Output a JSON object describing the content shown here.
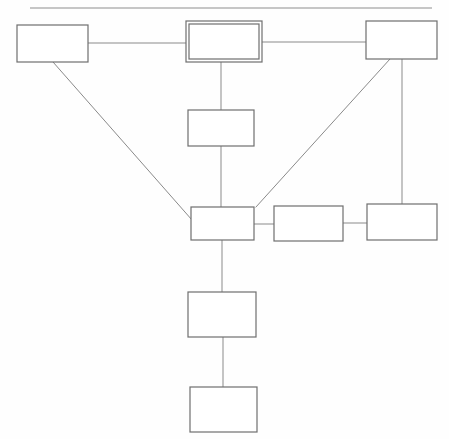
{
  "page": {
    "width": 449,
    "height": 439,
    "background_color": "#fefefe",
    "header_rule": {
      "name": "top-horizontal-rule",
      "x1": 30,
      "y1": 8,
      "x2": 432,
      "y2": 8,
      "color": "#8d8d8d",
      "stroke_width": 1.2
    }
  },
  "style": {
    "box_stroke_color": "#6e6e6e",
    "box_stroke_width": 1.2,
    "box_fill_color": "#ffffff",
    "connector_color": "#8a8a8a",
    "connector_width": 1,
    "emphasis_stroke_color": "#6e6e6e"
  },
  "nodes": [
    {
      "id": "node-top-left",
      "name": "box-top-left",
      "label": "",
      "x": 17,
      "y": 25,
      "width": 71,
      "height": 37,
      "double_border": false
    },
    {
      "id": "node-top-center",
      "name": "box-top-center-emphasized",
      "label": "",
      "x": 186,
      "y": 21,
      "width": 76,
      "height": 41,
      "double_border": true,
      "inner_inset": 3
    },
    {
      "id": "node-top-right",
      "name": "box-top-right",
      "label": "",
      "x": 366,
      "y": 21,
      "width": 71,
      "height": 38,
      "double_border": false
    },
    {
      "id": "node-second-row",
      "name": "box-second-row-center",
      "label": "",
      "x": 188,
      "y": 110,
      "width": 66,
      "height": 36,
      "double_border": false
    },
    {
      "id": "node-hub",
      "name": "box-center-hub",
      "label": "",
      "x": 191,
      "y": 207,
      "width": 63,
      "height": 33,
      "double_border": false
    },
    {
      "id": "node-mid-right",
      "name": "box-middle-right",
      "label": "",
      "x": 274,
      "y": 206,
      "width": 69,
      "height": 35,
      "double_border": false
    },
    {
      "id": "node-far-right",
      "name": "box-far-right",
      "label": "",
      "x": 367,
      "y": 204,
      "width": 70,
      "height": 36,
      "double_border": false
    },
    {
      "id": "node-lower-center",
      "name": "box-lower-center",
      "label": "",
      "x": 188,
      "y": 292,
      "width": 68,
      "height": 45,
      "double_border": false
    },
    {
      "id": "node-bottom-center",
      "name": "box-bottom-center",
      "label": "",
      "x": 190,
      "y": 387,
      "width": 67,
      "height": 45,
      "double_border": false
    }
  ],
  "connectors": [
    {
      "id": "conn-topleft-topcenter",
      "name": "connector-top-left-to-top-center",
      "from": "node-top-left",
      "to": "node-top-center",
      "kind": "horizontal",
      "x1": 88,
      "y1": 43,
      "x2": 186,
      "y2": 43
    },
    {
      "id": "conn-topcenter-topright",
      "name": "connector-top-center-to-top-right",
      "from": "node-top-center",
      "to": "node-top-right",
      "kind": "horizontal",
      "x1": 262,
      "y1": 42,
      "x2": 366,
      "y2": 42
    },
    {
      "id": "conn-topcenter-secondrow",
      "name": "connector-top-center-to-second-row",
      "from": "node-top-center",
      "to": "node-second-row",
      "kind": "vertical",
      "x1": 221,
      "y1": 62,
      "x2": 221,
      "y2": 110
    },
    {
      "id": "conn-secondrow-hub",
      "name": "connector-second-row-to-hub",
      "from": "node-second-row",
      "to": "node-hub",
      "kind": "vertical",
      "x1": 221,
      "y1": 146,
      "x2": 221,
      "y2": 207
    },
    {
      "id": "conn-topleft-hub-diagonal",
      "name": "connector-top-left-to-hub-diagonal",
      "from": "node-top-left",
      "to": "node-hub",
      "kind": "diagonal",
      "x1": 53,
      "y1": 62,
      "x2": 192,
      "y2": 220
    },
    {
      "id": "conn-topright-hub-diagonal",
      "name": "connector-top-right-to-hub-diagonal",
      "from": "node-top-right",
      "to": "node-hub",
      "kind": "diagonal",
      "x1": 390,
      "y1": 59,
      "x2": 256,
      "y2": 207
    },
    {
      "id": "conn-topright-farright",
      "name": "connector-top-right-to-far-right",
      "from": "node-top-right",
      "to": "node-far-right",
      "kind": "vertical",
      "x1": 402,
      "y1": 59,
      "x2": 402,
      "y2": 204
    },
    {
      "id": "conn-hub-midright",
      "name": "connector-hub-to-middle-right",
      "from": "node-hub",
      "to": "node-mid-right",
      "kind": "horizontal",
      "x1": 254,
      "y1": 224,
      "x2": 274,
      "y2": 224
    },
    {
      "id": "conn-midright-farright",
      "name": "connector-middle-right-to-far-right",
      "from": "node-mid-right",
      "to": "node-far-right",
      "kind": "horizontal",
      "x1": 343,
      "y1": 223,
      "x2": 367,
      "y2": 223
    },
    {
      "id": "conn-hub-lowercenter",
      "name": "connector-hub-to-lower-center",
      "from": "node-hub",
      "to": "node-lower-center",
      "kind": "vertical",
      "x1": 222,
      "y1": 240,
      "x2": 222,
      "y2": 292
    },
    {
      "id": "conn-lowercenter-bottomcenter",
      "name": "connector-lower-center-to-bottom-center",
      "from": "node-lower-center",
      "to": "node-bottom-center",
      "kind": "vertical",
      "x1": 223,
      "y1": 337,
      "x2": 223,
      "y2": 387
    }
  ]
}
